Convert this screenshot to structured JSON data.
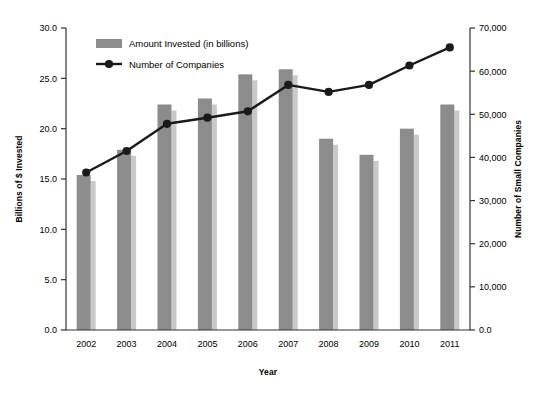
{
  "chart_data": {
    "type": "bar",
    "title": "",
    "xlabel": "Year",
    "ylabel": "Billions of $ Invested",
    "y2label": "Number of Small Companies",
    "categories": [
      "2002",
      "2003",
      "2004",
      "2005",
      "2006",
      "2007",
      "2008",
      "2009",
      "2010",
      "2011"
    ],
    "grid": false,
    "legend_position": "top-left",
    "ylim": [
      0,
      30
    ],
    "y2lim": [
      0,
      70000
    ],
    "yticks": [
      "0.0",
      "5.0",
      "10.0",
      "15.0",
      "20.0",
      "25.0",
      "30.0"
    ],
    "ytick_values": [
      0,
      5,
      10,
      15,
      20,
      25,
      30
    ],
    "y2ticks": [
      "0.0",
      "10,000",
      "20,000",
      "30,000",
      "40,000",
      "50,000",
      "60,000",
      "70,000"
    ],
    "y2tick_values": [
      0,
      10000,
      20000,
      30000,
      40000,
      50000,
      60000,
      70000
    ],
    "series": [
      {
        "name": "Amount Invested (in billions)",
        "type": "bar",
        "axis": "left",
        "color": "#8c8c8c",
        "shadow_color": "#c9c9c9",
        "values": [
          15.4,
          17.9,
          22.4,
          23.0,
          25.4,
          25.9,
          19.0,
          17.4,
          20.0,
          22.4
        ]
      },
      {
        "name": "Number of Companies",
        "type": "line",
        "axis": "right",
        "color": "#1a1a1a",
        "marker": "circle",
        "values": [
          36500,
          41500,
          47800,
          49200,
          50700,
          56800,
          55200,
          56800,
          61300,
          65500
        ]
      }
    ]
  },
  "legend": {
    "items": [
      {
        "label": "Amount Invested (in billions)",
        "kind": "swatch"
      },
      {
        "label": "Number of Companies",
        "kind": "line-marker"
      }
    ]
  },
  "colors": {
    "bar": "#8c8c8c",
    "bar_shadow": "#c9c9c9",
    "line": "#1a1a1a",
    "axis": "#333333",
    "text": "#111111",
    "background": "#ffffff"
  }
}
